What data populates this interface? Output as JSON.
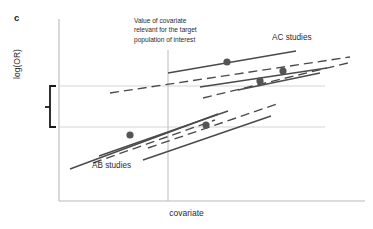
{
  "figure": {
    "panel_label": "c",
    "y_axis_label": "log(OR)",
    "x_axis_label": "covariate",
    "annotation_lines": [
      "Value of covariate",
      "relevant for the target",
      "population of interest"
    ],
    "group_labels": {
      "ac": "AC studies",
      "ab": "AB studies"
    }
  },
  "colors": {
    "axis": "#b9b9b9",
    "guide_line": "#d0d0d0",
    "reference_line": "#bdbdbd",
    "curve": "#4a4a4a",
    "marker": "#545454",
    "bracket": "#1a1a1a",
    "text": "#2b2b2b"
  },
  "chart_data": {
    "type": "line",
    "title": "",
    "xlabel": "covariate",
    "ylabel": "log(OR)",
    "grid": false,
    "legend": "inline-annotations",
    "axis_box": {
      "x0": 59,
      "y0": 19,
      "x1": 365,
      "y1": 201
    },
    "reference_line_x": 168,
    "reference_line_y_top": 50,
    "guide_lines_y": [
      86,
      127
    ],
    "bracket": {
      "x": 50,
      "y_top": 86,
      "y_bottom": 127,
      "tick_y": 107
    },
    "groups": [
      {
        "name": "AB studies",
        "label_pos": [
          92,
          161
        ],
        "lines": [
          {
            "style": "solid",
            "x1": 70,
            "y1": 169,
            "x2": 218,
            "y2": 114
          },
          {
            "style": "solid",
            "x1": 99,
            "y1": 156,
            "x2": 228,
            "y2": 111
          },
          {
            "style": "dashed",
            "x1": 93,
            "y1": 163,
            "x2": 215,
            "y2": 120
          },
          {
            "style": "dashed",
            "x1": 148,
            "y1": 148,
            "x2": 280,
            "y2": 103
          },
          {
            "style": "solid",
            "x1": 143,
            "y1": 160,
            "x2": 271,
            "y2": 116
          }
        ],
        "markers": [
          {
            "x": 130,
            "y": 135
          },
          {
            "x": 206,
            "y": 125
          }
        ]
      },
      {
        "name": "AC studies",
        "label_pos": [
          272,
          33
        ],
        "lines": [
          {
            "style": "solid",
            "x1": 168,
            "y1": 73,
            "x2": 296,
            "y2": 51
          },
          {
            "style": "dashed",
            "x1": 110,
            "y1": 93,
            "x2": 350,
            "y2": 57
          },
          {
            "style": "solid",
            "x1": 200,
            "y1": 87,
            "x2": 327,
            "y2": 68
          },
          {
            "style": "dashed",
            "x1": 203,
            "y1": 98,
            "x2": 352,
            "y2": 62
          },
          {
            "style": "solid",
            "x1": 238,
            "y1": 90,
            "x2": 320,
            "y2": 73
          }
        ],
        "markers": [
          {
            "x": 227,
            "y": 62
          },
          {
            "x": 283,
            "y": 71
          },
          {
            "x": 260,
            "y": 81
          }
        ]
      }
    ]
  }
}
